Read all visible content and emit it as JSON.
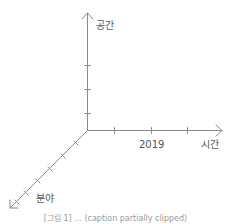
{
  "diagram": {
    "type": "3d-axes",
    "colors": {
      "axis": "#8a8a8a",
      "label": "#555555",
      "caption": "#9a9a9a",
      "background": "#ffffff"
    },
    "axes": {
      "vertical": {
        "label": "공간",
        "ticks": 3
      },
      "horizontal": {
        "label": "시간",
        "ticks": 3,
        "tick_label": "2019"
      },
      "diagonal": {
        "label": "분야",
        "ticks": 6
      }
    },
    "caption": "[그림 1] ... (caption partially clipped)"
  }
}
